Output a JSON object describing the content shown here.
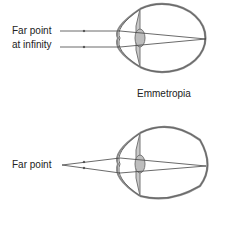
{
  "top": {
    "label_line1": "Far point",
    "label_line2": "at infinity",
    "caption": "Emmetropia"
  },
  "bottom": {
    "label": "Far point"
  },
  "colors": {
    "line": "#555555",
    "lens": "#bdbdbd",
    "iris": "#9a9a9a"
  }
}
